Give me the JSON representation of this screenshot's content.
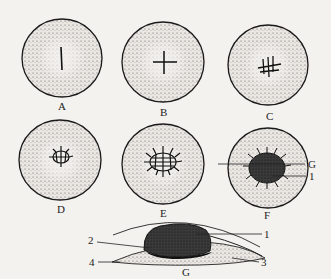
{
  "figure": {
    "panels": [
      {
        "id": "A",
        "label": "A"
      },
      {
        "id": "B",
        "label": "B"
      },
      {
        "id": "C",
        "label": "C"
      },
      {
        "id": "D",
        "label": "D"
      },
      {
        "id": "E",
        "label": "E"
      },
      {
        "id": "F",
        "label": "F"
      }
    ],
    "panel_f_callouts": [
      {
        "label": "G"
      },
      {
        "label": "1"
      }
    ],
    "cross_section": {
      "label": "G",
      "callouts": [
        {
          "label": "1"
        },
        {
          "label": "2"
        },
        {
          "label": "3"
        },
        {
          "label": "4"
        }
      ]
    },
    "colors": {
      "background": "#f4f2ef",
      "ink": "#1a1a1a",
      "stipple": "#555555"
    }
  }
}
